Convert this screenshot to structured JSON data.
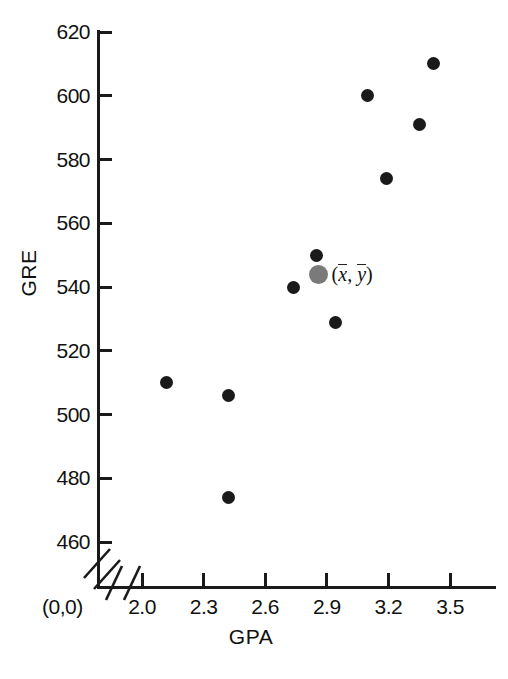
{
  "chart_data": {
    "type": "scatter",
    "title": "",
    "xlabel": "GPA",
    "ylabel": "GRE",
    "xlim": [
      1.88,
      3.62
    ],
    "ylim": [
      456,
      622
    ],
    "grid": false,
    "legend": null,
    "x_ticks": [
      "2.0",
      "2.3",
      "2.6",
      "2.9",
      "3.2",
      "3.5"
    ],
    "x_tick_values": [
      2.0,
      2.3,
      2.6,
      2.9,
      3.2,
      3.5
    ],
    "y_ticks": [
      "460",
      "480",
      "500",
      "520",
      "540",
      "560",
      "580",
      "600",
      "620"
    ],
    "y_tick_values": [
      460,
      480,
      500,
      520,
      540,
      560,
      580,
      600,
      620
    ],
    "origin_label": "(0,0)",
    "axis_break": true,
    "x": [
      2.12,
      2.42,
      2.42,
      2.74,
      2.85,
      2.94,
      3.1,
      3.19,
      3.35,
      3.42
    ],
    "y": [
      510,
      506,
      474,
      540,
      550,
      529,
      600,
      574,
      591,
      610
    ],
    "points": [
      {
        "x": 2.12,
        "y": 510
      },
      {
        "x": 2.42,
        "y": 506
      },
      {
        "x": 2.42,
        "y": 474
      },
      {
        "x": 2.74,
        "y": 540
      },
      {
        "x": 2.85,
        "y": 550
      },
      {
        "x": 2.94,
        "y": 529
      },
      {
        "x": 3.1,
        "y": 600
      },
      {
        "x": 3.19,
        "y": 574
      },
      {
        "x": 3.35,
        "y": 591
      },
      {
        "x": 3.42,
        "y": 610
      }
    ],
    "annotations": [
      {
        "name": "centroid",
        "x": 2.86,
        "y": 544,
        "label": "(x̅, y̅)",
        "color": "#7a7a7a",
        "marker": "circle",
        "size": "large"
      }
    ],
    "colors": {
      "point": "#1a1a1a",
      "centroid": "#7a7a7a",
      "axis": "#1a1a1a",
      "background": "#ffffff"
    }
  },
  "centroid_label": {
    "open_paren": "(",
    "x_symbol": "x",
    "comma": ",",
    "y_symbol": "y",
    "close_paren": ")"
  }
}
